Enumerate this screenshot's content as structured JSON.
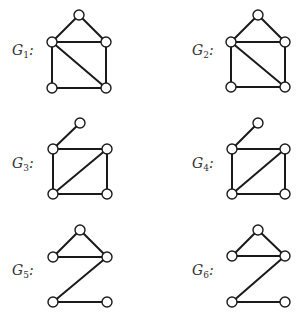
{
  "figure": {
    "graphs": [
      {
        "id": "G1",
        "label_base": "G",
        "label_sub": "1",
        "label_suffix": ":",
        "label_pos": [
          12,
          43
        ],
        "nodes": [
          [
            79,
            15
          ],
          [
            52,
            42
          ],
          [
            106,
            42
          ],
          [
            52,
            88
          ],
          [
            106,
            88
          ]
        ],
        "edges": [
          [
            0,
            1
          ],
          [
            0,
            2
          ],
          [
            1,
            2
          ],
          [
            1,
            3
          ],
          [
            2,
            4
          ],
          [
            3,
            4
          ],
          [
            1,
            4
          ]
        ]
      },
      {
        "id": "G2",
        "label_base": "G",
        "label_sub": "2",
        "label_suffix": ":",
        "label_pos": [
          192,
          43
        ],
        "nodes": [
          [
            258,
            15
          ],
          [
            231,
            42
          ],
          [
            285,
            42
          ],
          [
            231,
            87
          ],
          [
            285,
            87
          ]
        ],
        "edges": [
          [
            0,
            1
          ],
          [
            0,
            2
          ],
          [
            1,
            2
          ],
          [
            1,
            3
          ],
          [
            2,
            4
          ],
          [
            3,
            4
          ],
          [
            1,
            4
          ]
        ]
      },
      {
        "id": "G3",
        "label_base": "G",
        "label_sub": "3",
        "label_suffix": ":",
        "label_pos": [
          12,
          156
        ],
        "nodes": [
          [
            80,
            123
          ],
          [
            53,
            149
          ],
          [
            107,
            149
          ],
          [
            53,
            194
          ],
          [
            107,
            194
          ]
        ],
        "edges": [
          [
            0,
            1
          ],
          [
            1,
            2
          ],
          [
            1,
            3
          ],
          [
            2,
            4
          ],
          [
            3,
            4
          ],
          [
            3,
            2
          ]
        ]
      },
      {
        "id": "G4",
        "label_base": "G",
        "label_sub": "4",
        "label_suffix": ":",
        "label_pos": [
          192,
          156
        ],
        "nodes": [
          [
            258,
            123
          ],
          [
            232,
            149
          ],
          [
            285,
            149
          ],
          [
            232,
            194
          ],
          [
            285,
            194
          ]
        ],
        "edges": [
          [
            0,
            1
          ],
          [
            1,
            2
          ],
          [
            1,
            3
          ],
          [
            2,
            4
          ],
          [
            3,
            4
          ],
          [
            3,
            2
          ]
        ]
      },
      {
        "id": "G5",
        "label_base": "G",
        "label_sub": "5",
        "label_suffix": ":",
        "label_pos": [
          12,
          263
        ],
        "nodes": [
          [
            80,
            230
          ],
          [
            53,
            257
          ],
          [
            107,
            257
          ],
          [
            53,
            302
          ],
          [
            107,
            302
          ]
        ],
        "edges": [
          [
            0,
            1
          ],
          [
            0,
            2
          ],
          [
            1,
            2
          ],
          [
            2,
            3
          ],
          [
            3,
            4
          ]
        ]
      },
      {
        "id": "G6",
        "label_base": "G",
        "label_sub": "6",
        "label_suffix": ":",
        "label_pos": [
          192,
          263
        ],
        "nodes": [
          [
            258,
            230
          ],
          [
            232,
            256
          ],
          [
            285,
            256
          ],
          [
            232,
            302
          ],
          [
            285,
            302
          ]
        ],
        "edges": [
          [
            0,
            1
          ],
          [
            0,
            2
          ],
          [
            1,
            2
          ],
          [
            2,
            3
          ],
          [
            3,
            4
          ]
        ]
      }
    ],
    "node_radius": 5,
    "colors": {
      "edge": "#1a1a1a",
      "node_fill": "#ffffff",
      "node_stroke": "#1a1a1a",
      "label": "#333333"
    }
  }
}
